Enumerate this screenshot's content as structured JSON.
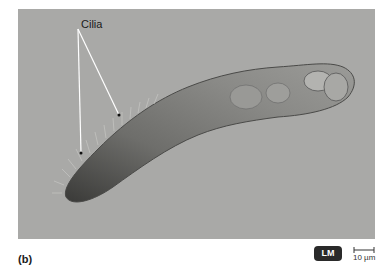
{
  "figure": {
    "panel_letter": "(b)",
    "annotation_label": "Cilia",
    "microscopy_badge": "LM",
    "scale_bar_text": "10 µm",
    "background_color": "#a9a9a7",
    "badge_color": "#2a2a2a"
  }
}
